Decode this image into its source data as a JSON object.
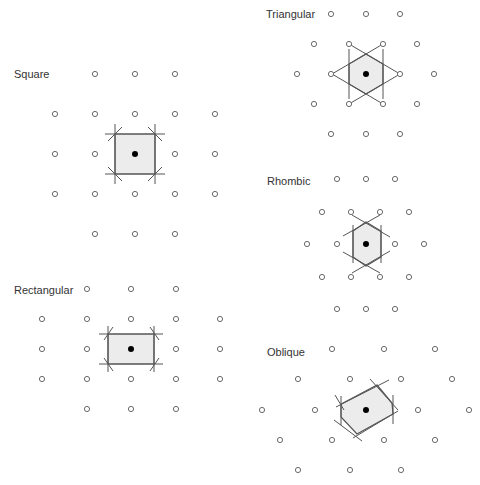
{
  "colors": {
    "background": "#ffffff",
    "lattice_point_stroke": "#6a6a6a",
    "center_point": "#000000",
    "cell_fill": "#ececec",
    "cell_stroke": "#555555",
    "label_text": "#333333"
  },
  "panels": [
    {
      "id": "square",
      "label": "Square",
      "label_pos": [
        14,
        69
      ],
      "center": [
        135,
        154
      ],
      "points": [
        [
          95,
          74
        ],
        [
          135,
          74
        ],
        [
          175,
          74
        ],
        [
          55,
          114
        ],
        [
          95,
          114
        ],
        [
          135,
          114
        ],
        [
          175,
          114
        ],
        [
          215,
          114
        ],
        [
          55,
          154
        ],
        [
          95,
          154
        ],
        [
          175,
          154
        ],
        [
          215,
          154
        ],
        [
          55,
          194
        ],
        [
          95,
          194
        ],
        [
          135,
          194
        ],
        [
          175,
          194
        ],
        [
          215,
          194
        ],
        [
          95,
          234
        ],
        [
          135,
          234
        ],
        [
          175,
          234
        ]
      ],
      "cell": [
        [
          115,
          134
        ],
        [
          155,
          134
        ],
        [
          155,
          174
        ],
        [
          115,
          174
        ]
      ],
      "lines": [
        [
          105,
          134,
          165,
          134
        ],
        [
          105,
          174,
          165,
          174
        ],
        [
          115,
          124,
          115,
          184
        ],
        [
          155,
          124,
          155,
          184
        ],
        [
          108,
          141,
          122,
          127
        ],
        [
          148,
          127,
          162,
          141
        ],
        [
          108,
          167,
          122,
          181
        ],
        [
          148,
          181,
          162,
          167
        ]
      ]
    },
    {
      "id": "rectangular",
      "label": "Rectangular",
      "label_pos": [
        14,
        285
      ],
      "center": [
        131,
        349
      ],
      "points": [
        [
          87,
          289
        ],
        [
          131,
          289
        ],
        [
          176,
          289
        ],
        [
          42,
          319
        ],
        [
          87,
          319
        ],
        [
          131,
          319
        ],
        [
          176,
          319
        ],
        [
          220,
          319
        ],
        [
          42,
          349
        ],
        [
          87,
          349
        ],
        [
          176,
          349
        ],
        [
          220,
          349
        ],
        [
          42,
          379
        ],
        [
          87,
          379
        ],
        [
          131,
          379
        ],
        [
          176,
          379
        ],
        [
          220,
          379
        ],
        [
          87,
          409
        ],
        [
          131,
          409
        ],
        [
          176,
          409
        ]
      ],
      "cell": [
        [
          108,
          334
        ],
        [
          154,
          334
        ],
        [
          154,
          364
        ],
        [
          108,
          364
        ]
      ],
      "lines": [
        [
          99,
          334,
          163,
          334
        ],
        [
          99,
          364,
          163,
          364
        ],
        [
          108,
          326,
          108,
          372
        ],
        [
          154,
          326,
          154,
          372
        ],
        [
          104,
          340,
          113,
          327
        ],
        [
          150,
          327,
          159,
          340
        ],
        [
          104,
          358,
          113,
          371
        ],
        [
          150,
          371,
          159,
          358
        ]
      ]
    },
    {
      "id": "triangular",
      "label": "Triangular",
      "label_pos": [
        266,
        9
      ],
      "center": [
        366,
        74
      ],
      "points": [
        [
          331,
          14
        ],
        [
          366,
          14
        ],
        [
          400,
          14
        ],
        [
          314,
          44
        ],
        [
          349,
          44
        ],
        [
          383,
          44
        ],
        [
          417,
          44
        ],
        [
          297,
          74
        ],
        [
          331,
          74
        ],
        [
          400,
          74
        ],
        [
          434,
          74
        ],
        [
          314,
          104
        ],
        [
          349,
          104
        ],
        [
          383,
          104
        ],
        [
          417,
          104
        ],
        [
          331,
          134
        ],
        [
          366,
          134
        ],
        [
          400,
          134
        ]
      ],
      "cell": [
        [
          366,
          54
        ],
        [
          383,
          64
        ],
        [
          383,
          84
        ],
        [
          366,
          94
        ],
        [
          349,
          84
        ],
        [
          349,
          64
        ]
      ],
      "lines": [
        [
          349,
          49,
          349,
          99
        ],
        [
          383,
          49,
          383,
          99
        ],
        [
          332,
          74,
          383,
          44
        ],
        [
          349,
          44,
          400,
          74
        ],
        [
          332,
          74,
          383,
          104
        ],
        [
          349,
          104,
          400,
          74
        ]
      ]
    },
    {
      "id": "rhombic",
      "label": "Rhombic",
      "label_pos": [
        267,
        176
      ],
      "center": [
        366,
        244
      ],
      "points": [
        [
          337,
          179
        ],
        [
          366,
          179
        ],
        [
          395,
          179
        ],
        [
          322,
          212
        ],
        [
          351,
          212
        ],
        [
          380,
          212
        ],
        [
          409,
          212
        ],
        [
          307,
          244
        ],
        [
          337,
          244
        ],
        [
          395,
          244
        ],
        [
          424,
          244
        ],
        [
          322,
          277
        ],
        [
          351,
          277
        ],
        [
          380,
          277
        ],
        [
          409,
          277
        ],
        [
          337,
          309
        ],
        [
          366,
          309
        ],
        [
          395,
          309
        ]
      ],
      "cell": [
        [
          366,
          222
        ],
        [
          381,
          231
        ],
        [
          381,
          257
        ],
        [
          366,
          266
        ],
        [
          353,
          257
        ],
        [
          353,
          231
        ]
      ],
      "lines": [
        [
          353,
          225,
          353,
          263
        ],
        [
          381,
          225,
          381,
          263
        ],
        [
          343,
          236,
          380,
          215
        ],
        [
          352,
          215,
          390,
          237
        ],
        [
          343,
          252,
          380,
          273
        ],
        [
          352,
          273,
          390,
          251
        ]
      ]
    },
    {
      "id": "oblique",
      "label": "Oblique",
      "label_pos": [
        267,
        347
      ],
      "center": [
        366,
        410
      ],
      "points": [
        [
          332,
          349
        ],
        [
          384,
          349
        ],
        [
          435,
          349
        ],
        [
          298,
          379
        ],
        [
          350,
          379
        ],
        [
          401,
          379
        ],
        [
          452,
          379
        ],
        [
          262,
          410
        ],
        [
          315,
          410
        ],
        [
          418,
          410
        ],
        [
          469,
          410
        ],
        [
          280,
          440
        ],
        [
          332,
          440
        ],
        [
          384,
          440
        ],
        [
          435,
          440
        ],
        [
          298,
          470
        ],
        [
          350,
          470
        ],
        [
          401,
          470
        ]
      ],
      "cell": [
        [
          377,
          385
        ],
        [
          392,
          403
        ],
        [
          393,
          414
        ],
        [
          357,
          434
        ],
        [
          341,
          417
        ],
        [
          341,
          404
        ]
      ],
      "lines": [
        [
          341,
          396,
          341,
          425
        ],
        [
          393,
          395,
          393,
          424
        ],
        [
          336,
          407,
          389,
          380
        ],
        [
          370,
          379,
          398,
          410
        ],
        [
          334,
          420,
          362,
          441
        ],
        [
          353,
          438,
          398,
          411
        ],
        [
          335,
          395,
          344,
          410
        ]
      ]
    }
  ]
}
